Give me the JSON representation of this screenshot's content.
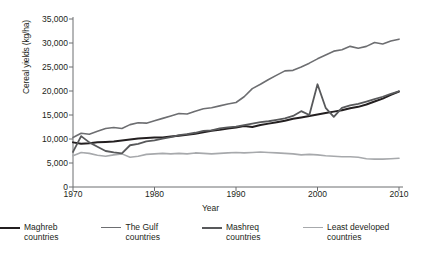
{
  "chart_data": {
    "type": "line",
    "title": "",
    "xlabel": "Year",
    "ylabel": "Cereal yields (kg/ha)",
    "xlim": [
      1970,
      2010
    ],
    "ylim": [
      0,
      35000
    ],
    "grid": false,
    "legend_position": "bottom",
    "xticks": [
      1970,
      1980,
      1990,
      2000,
      2010
    ],
    "xtick_labels": [
      "1970",
      "1980",
      "1990",
      "2000",
      "2010"
    ],
    "yticks": [
      0,
      5000,
      10000,
      15000,
      20000,
      25000,
      30000,
      35000
    ],
    "ytick_labels": [
      "0",
      "5,000",
      "10,000",
      "15,000",
      "20,000",
      "25,000",
      "30,000",
      "35,000"
    ],
    "x": [
      1970,
      1971,
      1972,
      1973,
      1974,
      1975,
      1976,
      1977,
      1978,
      1979,
      1980,
      1981,
      1982,
      1983,
      1984,
      1985,
      1986,
      1987,
      1988,
      1989,
      1990,
      1991,
      1992,
      1993,
      1994,
      1995,
      1996,
      1997,
      1998,
      1999,
      2000,
      2001,
      2002,
      2003,
      2004,
      2005,
      2006,
      2007,
      2008,
      2009,
      2010
    ],
    "series": [
      {
        "name": "Maghreb countries",
        "color": "#231f20",
        "width": 2.0,
        "values": [
          9300,
          9000,
          9100,
          9300,
          9400,
          9500,
          9700,
          9900,
          10100,
          10200,
          10300,
          10300,
          10500,
          10700,
          10900,
          11100,
          11400,
          11700,
          11900,
          12200,
          12400,
          12700,
          12500,
          12900,
          13200,
          13500,
          13800,
          14200,
          14500,
          14800,
          15100,
          15400,
          15700,
          16000,
          16400,
          16700,
          17200,
          17800,
          18400,
          19200,
          19900
        ]
      },
      {
        "name": "The Gulf countries",
        "color": "#6d6e71",
        "width": 1.6,
        "values": [
          10300,
          11200,
          11000,
          11600,
          12200,
          12400,
          12200,
          13000,
          13400,
          13300,
          13800,
          14300,
          14800,
          15300,
          15200,
          15800,
          16300,
          16500,
          16900,
          17300,
          17600,
          18800,
          20500,
          21400,
          22400,
          23300,
          24200,
          24300,
          25000,
          25800,
          26700,
          27500,
          28300,
          28600,
          29300,
          28900,
          29300,
          30100,
          29800,
          30400,
          30800
        ]
      },
      {
        "name": "Mashreq countries",
        "color": "#58595b",
        "width": 1.8,
        "values": [
          7300,
          10600,
          9300,
          8400,
          7500,
          7200,
          7000,
          8700,
          9000,
          9500,
          9700,
          10100,
          10400,
          10800,
          11000,
          11300,
          11700,
          11800,
          12200,
          12400,
          12600,
          12900,
          13200,
          13500,
          13700,
          14000,
          14300,
          14800,
          15800,
          15000,
          21400,
          16500,
          14600,
          16500,
          17000,
          17300,
          17800,
          18300,
          18800,
          19400,
          19900
        ]
      },
      {
        "name": "Least developed countries",
        "color": "#a7a9ac",
        "width": 1.6,
        "values": [
          6500,
          7200,
          7000,
          6600,
          6400,
          6700,
          6900,
          6200,
          6400,
          6800,
          6900,
          7000,
          6900,
          7000,
          6900,
          7100,
          7000,
          6900,
          7000,
          7100,
          7200,
          7100,
          7200,
          7300,
          7200,
          7100,
          7000,
          6900,
          6700,
          6800,
          6700,
          6500,
          6400,
          6300,
          6300,
          6200,
          5900,
          5800,
          5800,
          5900,
          6000
        ]
      }
    ]
  },
  "axis": {
    "line_color": "#6d6e71"
  },
  "legend": {
    "items": [
      {
        "label": "Maghreb countries",
        "color": "#231f20"
      },
      {
        "label": "The Gulf countries",
        "color": "#6d6e71"
      },
      {
        "label": "Mashreq countries",
        "color": "#58595b"
      },
      {
        "label": "Least developed countries",
        "color": "#a7a9ac"
      }
    ]
  }
}
